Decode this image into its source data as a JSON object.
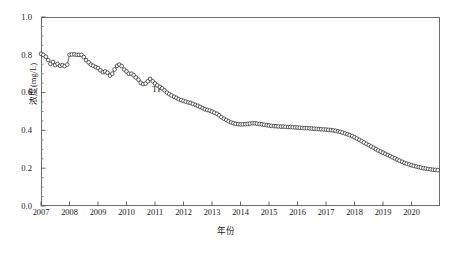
{
  "chart_data": {
    "type": "line",
    "title": "",
    "xlabel": "年份",
    "ylabel": "浓度(mg/L)",
    "xlim": [
      2007,
      2021
    ],
    "ylim": [
      0.0,
      1.0
    ],
    "grid": false,
    "legend_position": "inline-annotation",
    "marker": "open-circle",
    "line_color": "#333333",
    "marker_face_color": "#ffffff",
    "marker_edge_color": "#2b2b2b",
    "x_major_tick_labels": [
      "2007",
      "2008",
      "2009",
      "2010",
      "2011",
      "2012",
      "2013",
      "2014",
      "2015",
      "2016",
      "2017",
      "2018",
      "2019",
      "2020"
    ],
    "x_major_tick_values": [
      2007,
      2008,
      2009,
      2010,
      2011,
      2012,
      2013,
      2014,
      2015,
      2016,
      2017,
      2018,
      2019,
      2020
    ],
    "y_major_tick_labels": [
      "0.0",
      "0.2",
      "0.4",
      "0.6",
      "0.8",
      "1.0"
    ],
    "y_major_tick_values": [
      0.0,
      0.2,
      0.4,
      0.6,
      0.8,
      1.0
    ],
    "y_minor_tick_step": 0.05,
    "annotations": [
      {
        "text": "TP",
        "x": 2011.45,
        "y": 0.635
      }
    ],
    "series": [
      {
        "name": "TP",
        "x": [
          2007.0,
          2007.08,
          2007.17,
          2007.25,
          2007.33,
          2007.42,
          2007.5,
          2007.58,
          2007.67,
          2007.75,
          2007.83,
          2007.92,
          2008.0,
          2008.08,
          2008.17,
          2008.25,
          2008.33,
          2008.42,
          2008.5,
          2008.58,
          2008.67,
          2008.75,
          2008.83,
          2008.92,
          2009.0,
          2009.08,
          2009.17,
          2009.25,
          2009.33,
          2009.42,
          2009.5,
          2009.58,
          2009.67,
          2009.75,
          2009.83,
          2009.92,
          2010.0,
          2010.08,
          2010.17,
          2010.25,
          2010.33,
          2010.42,
          2010.5,
          2010.58,
          2010.67,
          2010.75,
          2010.83,
          2010.92,
          2011.0,
          2011.08,
          2011.17,
          2011.25,
          2011.33,
          2011.42,
          2011.5,
          2011.58,
          2011.67,
          2011.75,
          2011.83,
          2011.92,
          2012.0,
          2012.08,
          2012.17,
          2012.25,
          2012.33,
          2012.42,
          2012.5,
          2012.58,
          2012.67,
          2012.75,
          2012.83,
          2012.92,
          2013.0,
          2013.08,
          2013.17,
          2013.25,
          2013.33,
          2013.42,
          2013.5,
          2013.58,
          2013.67,
          2013.75,
          2013.83,
          2013.92,
          2014.0,
          2014.08,
          2014.17,
          2014.25,
          2014.33,
          2014.42,
          2014.5,
          2014.58,
          2014.67,
          2014.75,
          2014.83,
          2014.92,
          2015.0,
          2015.08,
          2015.17,
          2015.25,
          2015.33,
          2015.42,
          2015.5,
          2015.58,
          2015.67,
          2015.75,
          2015.83,
          2015.92,
          2016.0,
          2016.08,
          2016.17,
          2016.25,
          2016.33,
          2016.42,
          2016.5,
          2016.58,
          2016.67,
          2016.75,
          2016.83,
          2016.92,
          2017.0,
          2017.08,
          2017.17,
          2017.25,
          2017.33,
          2017.42,
          2017.5,
          2017.58,
          2017.67,
          2017.75,
          2017.83,
          2017.92,
          2018.0,
          2018.08,
          2018.17,
          2018.25,
          2018.33,
          2018.42,
          2018.5,
          2018.58,
          2018.67,
          2018.75,
          2018.83,
          2018.92,
          2019.0,
          2019.08,
          2019.17,
          2019.25,
          2019.33,
          2019.42,
          2019.5,
          2019.58,
          2019.67,
          2019.75,
          2019.83,
          2019.92,
          2020.0,
          2020.08,
          2020.17,
          2020.25,
          2020.33,
          2020.42,
          2020.5,
          2020.58,
          2020.67,
          2020.75,
          2020.83,
          2020.92
        ],
        "y": [
          0.805,
          0.8,
          0.79,
          0.772,
          0.752,
          0.762,
          0.745,
          0.752,
          0.742,
          0.745,
          0.74,
          0.748,
          0.8,
          0.802,
          0.802,
          0.8,
          0.8,
          0.8,
          0.788,
          0.772,
          0.76,
          0.748,
          0.742,
          0.735,
          0.73,
          0.718,
          0.708,
          0.712,
          0.705,
          0.69,
          0.7,
          0.722,
          0.742,
          0.748,
          0.74,
          0.722,
          0.712,
          0.7,
          0.7,
          0.692,
          0.68,
          0.668,
          0.652,
          0.645,
          0.648,
          0.66,
          0.672,
          0.66,
          0.648,
          0.638,
          0.63,
          0.622,
          0.612,
          0.6,
          0.592,
          0.585,
          0.578,
          0.572,
          0.565,
          0.56,
          0.556,
          0.552,
          0.548,
          0.545,
          0.54,
          0.535,
          0.53,
          0.524,
          0.518,
          0.512,
          0.508,
          0.505,
          0.5,
          0.494,
          0.488,
          0.48,
          0.47,
          0.462,
          0.455,
          0.448,
          0.442,
          0.438,
          0.435,
          0.433,
          0.432,
          0.432,
          0.433,
          0.434,
          0.436,
          0.438,
          0.438,
          0.436,
          0.434,
          0.432,
          0.43,
          0.428,
          0.426,
          0.424,
          0.423,
          0.422,
          0.421,
          0.42,
          0.42,
          0.419,
          0.418,
          0.418,
          0.417,
          0.416,
          0.415,
          0.414,
          0.413,
          0.412,
          0.412,
          0.411,
          0.41,
          0.409,
          0.408,
          0.407,
          0.406,
          0.405,
          0.404,
          0.403,
          0.402,
          0.4,
          0.398,
          0.395,
          0.392,
          0.388,
          0.384,
          0.38,
          0.375,
          0.37,
          0.364,
          0.357,
          0.35,
          0.343,
          0.336,
          0.329,
          0.322,
          0.315,
          0.308,
          0.301,
          0.294,
          0.288,
          0.282,
          0.276,
          0.27,
          0.264,
          0.258,
          0.252,
          0.246,
          0.24,
          0.234,
          0.228,
          0.224,
          0.22,
          0.216,
          0.212,
          0.209,
          0.206,
          0.203,
          0.2,
          0.198,
          0.196,
          0.194,
          0.192,
          0.191,
          0.19
        ]
      }
    ]
  },
  "figure": {
    "caption": ""
  }
}
